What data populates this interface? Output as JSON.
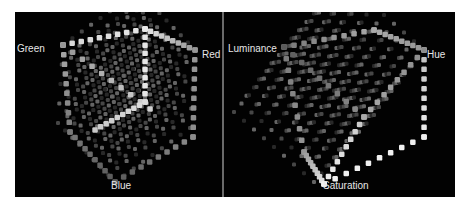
{
  "panels": [
    {
      "id": "rgb",
      "axis_labels": {
        "top_left": "Green",
        "top_right": "Red",
        "bottom": "Blue"
      }
    },
    {
      "id": "hsl",
      "axis_labels": {
        "top_left": "Luminance",
        "top_right": "Hue",
        "bottom": "Saturation"
      }
    }
  ],
  "colors": {
    "background": "#ffffff",
    "panel": "#020202",
    "label": "#e6e6e6",
    "divider": "#6a6a6a"
  }
}
